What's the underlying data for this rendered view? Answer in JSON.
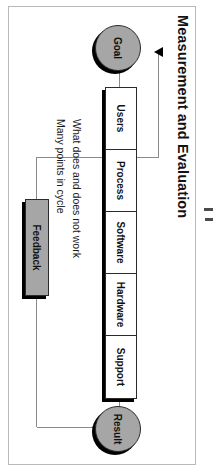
{
  "diagram": {
    "title": "Measurement and Evaluation",
    "nodes": {
      "goal": "Goal",
      "result": "Result",
      "feedback": "Feedback"
    },
    "stack": [
      {
        "label": "Users"
      },
      {
        "label": "Process"
      },
      {
        "label": "Software"
      },
      {
        "label": "Hardware"
      },
      {
        "label": "Support"
      }
    ],
    "notes": [
      "What does and does not work",
      "Many points in cycle"
    ],
    "colors": {
      "node_fill": "#a6a6a6",
      "box_fill": "#ffffff",
      "outline": "#2b2b2b",
      "shadow": "#000000",
      "connector": "#8a8a8a",
      "frame": "#b9b9b9",
      "text": "#111111"
    }
  }
}
